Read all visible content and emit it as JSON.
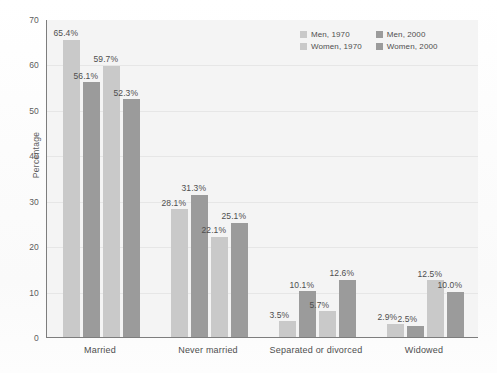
{
  "chart_data": {
    "type": "bar",
    "title": "",
    "subtitle": "",
    "xlabel": "",
    "ylabel": "Percentage",
    "ylim": [
      0,
      70
    ],
    "ytick_step": 10,
    "yticks": [
      "70",
      "60",
      "50",
      "40",
      "30",
      "20",
      "10",
      "0"
    ],
    "grid": true,
    "legend_position": "top-right",
    "categories": [
      "Married",
      "Never married",
      "Separated or divorced",
      "Widowed"
    ],
    "series": [
      {
        "name": "Men, 1970",
        "color": "#c9c9c9",
        "values": [
          65.4,
          28.1,
          3.5,
          2.9
        ],
        "labels": [
          "65.4%",
          "28.1%",
          "3.5%",
          "2.9%"
        ]
      },
      {
        "name": "Women, 1970",
        "color": "#9b9b9b",
        "values": [
          56.1,
          31.3,
          10.1,
          2.5
        ],
        "labels": [
          "56.1%",
          "31.3%",
          "10.1%",
          "2.5%"
        ]
      },
      {
        "name": "Men, 2000",
        "color": "#c9c9c9",
        "values": [
          59.7,
          22.1,
          5.7,
          12.5
        ],
        "labels": [
          "59.7%",
          "22.1%",
          "5.7%",
          "12.5%"
        ]
      },
      {
        "name": "Women, 2000",
        "color": "#9b9b9b",
        "values": [
          52.3,
          25.1,
          12.6,
          10.0
        ],
        "labels": [
          "52.3%",
          "25.1%",
          "12.6%",
          "10.0%"
        ]
      }
    ]
  },
  "legend": {
    "entries": [
      {
        "label": "Men, 1970",
        "color": "#c9c9c9"
      },
      {
        "label": "Men, 2000",
        "color": "#9b9b9b"
      },
      {
        "label": "Women, 1970",
        "color": "#c9c9c9"
      },
      {
        "label": "Women, 2000",
        "color": "#9b9b9b"
      }
    ]
  }
}
